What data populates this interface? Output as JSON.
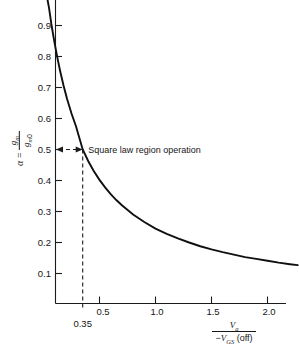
{
  "chart_data": {
    "type": "line",
    "title": "",
    "subtitle": "",
    "xlabel_numerator": "Vg",
    "xlabel_denominator": "-VGS (off)",
    "ylabel": "alpha = gm / gm0",
    "grid": false,
    "legend": "none",
    "xlim": [
      0.0,
      2.27
    ],
    "ylim": [
      0.0,
      0.98
    ],
    "x_ticks": [
      0.5,
      1.0,
      1.5,
      2.0
    ],
    "x_tick_labels": [
      "0.5",
      "1.0",
      "1.5",
      "2.0"
    ],
    "y_ticks": [
      0.1,
      0.2,
      0.3,
      0.4,
      0.5,
      0.6,
      0.7,
      0.8,
      0.9
    ],
    "y_tick_labels": [
      "0.1",
      "0.2",
      "0.3",
      "0.4",
      "0.5",
      "0.6",
      "0.7",
      "0.8",
      "0.9"
    ],
    "series": [
      {
        "name": "alpha vs Vg/-VGS(off)",
        "x": [
          0.035,
          0.05,
          0.07,
          0.09,
          0.11,
          0.13,
          0.15,
          0.18,
          0.21,
          0.25,
          0.29,
          0.35,
          0.4,
          0.45,
          0.5,
          0.55,
          0.6,
          0.65,
          0.7,
          0.8,
          0.9,
          1.0,
          1.1,
          1.2,
          1.3,
          1.4,
          1.5,
          1.6,
          1.7,
          1.8,
          1.9,
          2.0,
          2.1,
          2.2,
          2.27
        ],
        "y": [
          0.985,
          0.955,
          0.905,
          0.862,
          0.822,
          0.785,
          0.751,
          0.705,
          0.664,
          0.616,
          0.575,
          0.5,
          0.462,
          0.43,
          0.402,
          0.378,
          0.356,
          0.337,
          0.32,
          0.29,
          0.266,
          0.245,
          0.228,
          0.213,
          0.2,
          0.188,
          0.178,
          0.169,
          0.161,
          0.153,
          0.147,
          0.141,
          0.135,
          0.13,
          0.127
        ]
      }
    ],
    "annotations": [
      {
        "name": "square-law-region",
        "text": "Square law region operation",
        "arrow_from_x": 0.0,
        "arrow_to_x": 0.35,
        "arrow_y": 0.5,
        "double_headed": true
      },
      {
        "name": "x-marker-035",
        "text": "0.35",
        "x": 0.35,
        "vertical_dashed_line_to_y": 0.5
      }
    ],
    "colors": {
      "curve": "#101010",
      "axis": "#1b1b1b",
      "dashed": "#1b1b1b",
      "text": "#161616",
      "background": "#ffffff"
    }
  },
  "axis_titles": {
    "y": {
      "alpha": "α",
      "equals": "=",
      "numerator_base": "g",
      "numerator_sub": "m",
      "denominator_base": "g",
      "denominator_sub": "m",
      "denominator_sub2": "0"
    },
    "x": {
      "numerator_base": "V",
      "numerator_sub": "g",
      "denominator_sign": "−",
      "denominator_base": "V",
      "denominator_sub": "GS",
      "denominator_suffix": " (off)"
    }
  },
  "marker": {
    "value_label": "0.35"
  },
  "annotation": {
    "square_law_text": "Square law region operation"
  }
}
